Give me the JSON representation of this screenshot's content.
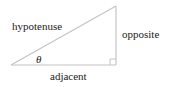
{
  "diagram": {
    "type": "right-triangle",
    "colors": {
      "line": "#c4c4c4",
      "text": "#222222",
      "background": "#ffffff"
    },
    "labels": {
      "hypotenuse": "hypotenuse",
      "opposite": "opposite",
      "adjacent": "adjacent",
      "angle": "θ"
    },
    "right_angle_marker": true
  }
}
